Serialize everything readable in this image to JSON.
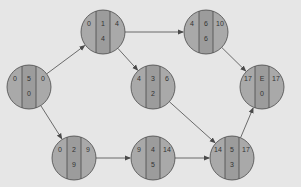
{
  "colors": {
    "background": "#e6e6e6",
    "node_outer": "#a9a9a9",
    "node_center": "#9c9c9c",
    "stroke": "#4a4a4a",
    "text": "#333333"
  },
  "nodes": [
    {
      "id": "start",
      "cx": 29,
      "cy": 87,
      "es": "0",
      "activity": "5",
      "ef": "0",
      "slack": "0"
    },
    {
      "id": "n1",
      "cx": 103,
      "cy": 32,
      "es": "0",
      "activity": "1",
      "ef": "4",
      "slack": "4"
    },
    {
      "id": "n6",
      "cx": 206,
      "cy": 32,
      "es": "4",
      "activity": "6",
      "ef": "10",
      "slack": "6"
    },
    {
      "id": "n3",
      "cx": 153,
      "cy": 87,
      "es": "4",
      "activity": "3",
      "ef": "6",
      "slack": "2"
    },
    {
      "id": "end",
      "cx": 262,
      "cy": 87,
      "es": "17",
      "activity": "E",
      "ef": "17",
      "slack": "0"
    },
    {
      "id": "n2",
      "cx": 74,
      "cy": 158,
      "es": "0",
      "activity": "2",
      "ef": "9",
      "slack": "9"
    },
    {
      "id": "n4",
      "cx": 153,
      "cy": 158,
      "es": "9",
      "activity": "4",
      "ef": "14",
      "slack": "5"
    },
    {
      "id": "n5",
      "cx": 232,
      "cy": 158,
      "es": "14",
      "activity": "5",
      "ef": "17",
      "slack": "3"
    }
  ],
  "edges": [
    {
      "from": "start",
      "to": "n1"
    },
    {
      "from": "start",
      "to": "n2"
    },
    {
      "from": "n1",
      "to": "n6"
    },
    {
      "from": "n1",
      "to": "n3"
    },
    {
      "from": "n6",
      "to": "end"
    },
    {
      "from": "n3",
      "to": "n5"
    },
    {
      "from": "n2",
      "to": "n4"
    },
    {
      "from": "n4",
      "to": "n5"
    },
    {
      "from": "n5",
      "to": "end"
    }
  ],
  "node_radius": 22
}
